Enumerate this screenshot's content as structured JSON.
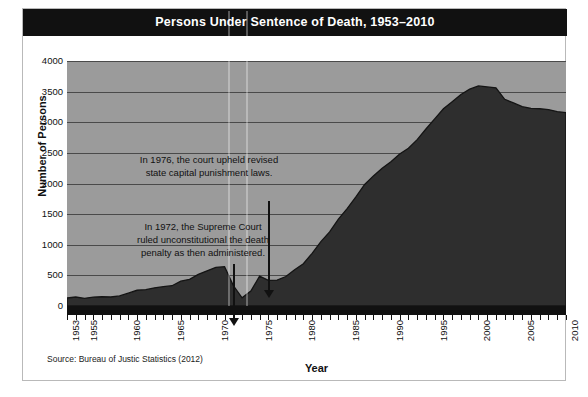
{
  "figure": {
    "title": "Persons Under Sentence of Death, 1953–2010",
    "source": "Source: Bureau of Justic Statistics (2012)"
  },
  "chart_data": {
    "type": "area",
    "title": "Persons Under Sentence of Death, 1953–2010",
    "xlabel": "Year",
    "ylabel": "Number of Persons",
    "xlim": [
      1953,
      2010
    ],
    "ylim": [
      0,
      4000
    ],
    "ytick_labels": [
      "4000",
      "3500",
      "3000",
      "2500",
      "2000",
      "1500",
      "1000",
      "500",
      "0"
    ],
    "ytick_values": [
      4000,
      3500,
      3000,
      2500,
      2000,
      1500,
      1000,
      500,
      0
    ],
    "xtick_labels": [
      "1953",
      "1955",
      "1960",
      "1965",
      "1970",
      "1975",
      "1980",
      "1985",
      "1990",
      "1995",
      "2000",
      "2005",
      "2010"
    ],
    "xtick_values": [
      1953,
      1955,
      1960,
      1965,
      1970,
      1975,
      1980,
      1985,
      1990,
      1995,
      2000,
      2005,
      2010
    ],
    "grid": true,
    "legend": "none",
    "series": [
      {
        "name": "Persons under sentence of death",
        "x": [
          1953,
          1954,
          1955,
          1956,
          1957,
          1958,
          1959,
          1960,
          1961,
          1962,
          1963,
          1964,
          1965,
          1966,
          1967,
          1968,
          1969,
          1970,
          1971,
          1972,
          1973,
          1974,
          1975,
          1976,
          1977,
          1978,
          1979,
          1980,
          1981,
          1982,
          1983,
          1984,
          1985,
          1986,
          1987,
          1988,
          1989,
          1990,
          1991,
          1992,
          1993,
          1994,
          1995,
          1996,
          1997,
          1998,
          1999,
          2000,
          2001,
          2002,
          2003,
          2004,
          2005,
          2006,
          2007,
          2008,
          2009,
          2010
        ],
        "y": [
          131,
          147,
          125,
          146,
          151,
          147,
          164,
          210,
          257,
          267,
          297,
          315,
          331,
          406,
          435,
          517,
          575,
          631,
          642,
          334,
          134,
          244,
          488,
          420,
          423,
          482,
          593,
          691,
          860,
          1050,
          1209,
          1420,
          1591,
          1781,
          1984,
          2124,
          2250,
          2356,
          2482,
          2575,
          2716,
          2890,
          3054,
          3219,
          3335,
          3452,
          3540,
          3593,
          3577,
          3562,
          3374,
          3315,
          3254,
          3228,
          3220,
          3207,
          3173,
          3158
        ]
      }
    ],
    "annotations": [
      {
        "id": "1976",
        "text": "In 1976, the court upheld revised\nstate capital punishment laws.",
        "points_to_year": 1976
      },
      {
        "id": "1972",
        "text": "In 1972, the Supreme Court\nruled unconstitutional the death\npenalty as then administered.",
        "points_to_year": 1972
      }
    ],
    "colors": {
      "plot_background": "#9b9b9b",
      "area_fill": "#2e2e2e",
      "gridline": "#4a4a4a",
      "axis": "#111111",
      "title_bar": "#111111",
      "title_text": "#ffffff"
    }
  }
}
